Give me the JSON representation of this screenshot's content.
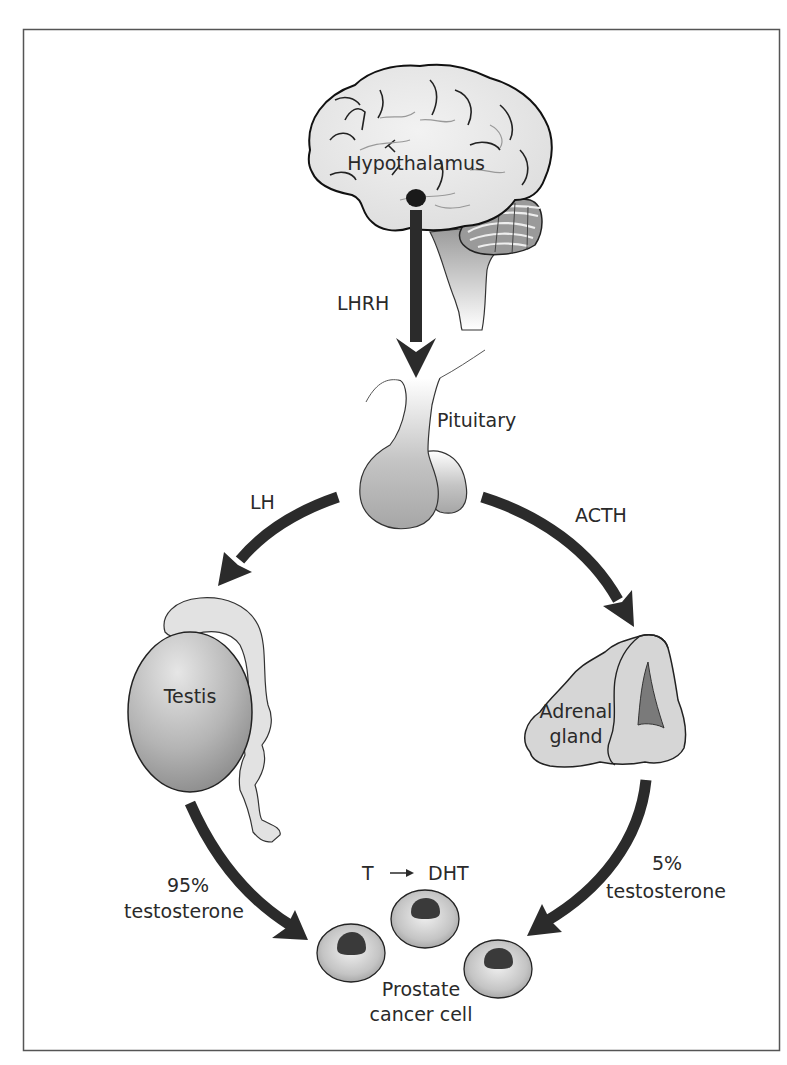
{
  "colors": {
    "frame": "#555555",
    "arrow": "#2b2b2b",
    "organ_light": "#e3e3e3",
    "organ_mid": "#bdbdbd",
    "organ_dark": "#8f8f8f",
    "nucleus": "#3a3a3a",
    "text": "#2a2a2a"
  },
  "nodes": {
    "hypothalamus": {
      "label": "Hypothalamus",
      "icon": "brain-icon"
    },
    "pituitary": {
      "label": "Pituitary",
      "icon": "pituitary-gland-icon"
    },
    "testis": {
      "label": "Testis",
      "icon": "testis-icon"
    },
    "adrenal": {
      "label_line1": "Adrenal",
      "label_line2": "gland",
      "icon": "adrenal-gland-icon"
    },
    "prostate": {
      "label_line1": "Prostate",
      "label_line2": "cancer cell",
      "icon": "cell-icon",
      "cell_count": 3
    }
  },
  "edges": [
    {
      "id": "lhrh",
      "from": "hypothalamus",
      "to": "pituitary",
      "label": "LHRH"
    },
    {
      "id": "lh",
      "from": "pituitary",
      "to": "testis",
      "label": "LH"
    },
    {
      "id": "acth",
      "from": "pituitary",
      "to": "adrenal",
      "label": "ACTH"
    },
    {
      "id": "testis-out",
      "from": "testis",
      "to": "prostate",
      "label_line1": "95%",
      "label_line2": "testosterone"
    },
    {
      "id": "adrenal-out",
      "from": "adrenal",
      "to": "prostate",
      "label_line1": "5%",
      "label_line2": "testosterone"
    }
  ],
  "conversion": {
    "from": "T",
    "arrow": "→",
    "to": "DHT"
  }
}
